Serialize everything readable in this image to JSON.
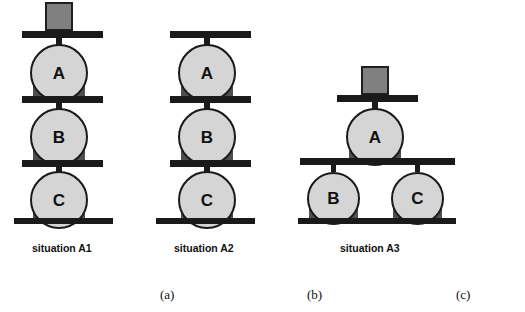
{
  "figure": {
    "title": "",
    "colors": {
      "ball_fill": "#d5d5d5",
      "ball_stroke": "#1a1a1a",
      "bar": "#1a1a1a",
      "support_block": "#4f4f4f",
      "weight_block": "#808080",
      "weight_block_border": "#1f1f1f",
      "background": "#ffffff",
      "text": "#111111"
    },
    "situations": [
      {
        "id": "a1",
        "caption": "situation A1",
        "panel_label": "(a)",
        "has_top_weight": true,
        "balls": [
          {
            "label": "A",
            "position": "top"
          },
          {
            "label": "B",
            "position": "middle"
          },
          {
            "label": "C",
            "position": "bottom"
          }
        ],
        "arrangement": "vertical-stack-of-three"
      },
      {
        "id": "a2",
        "caption": "situation A2",
        "panel_label": "(b)",
        "has_top_weight": false,
        "balls": [
          {
            "label": "A",
            "position": "top"
          },
          {
            "label": "B",
            "position": "middle"
          },
          {
            "label": "C",
            "position": "bottom"
          }
        ],
        "arrangement": "vertical-stack-of-three"
      },
      {
        "id": "a3",
        "caption": "situation A3",
        "panel_label": "(c)",
        "has_top_weight": true,
        "balls": [
          {
            "label": "A",
            "position": "top"
          },
          {
            "label": "B",
            "position": "bottom-left"
          },
          {
            "label": "C",
            "position": "bottom-right"
          }
        ],
        "arrangement": "one-on-two"
      }
    ]
  }
}
